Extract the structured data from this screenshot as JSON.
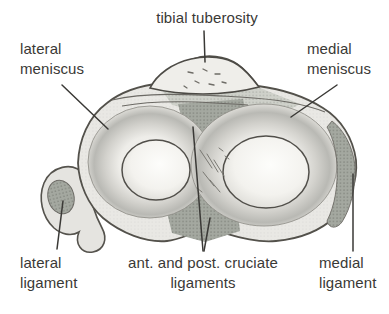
{
  "figure": {
    "type": "anatomical-diagram",
    "colors": {
      "background": "#ffffff",
      "label_text": "#3a3936",
      "leader_line": "#3a3936",
      "outline": "#53514b",
      "shade_light": "#e9e8e4",
      "shade_mid": "#c2c2bd",
      "shade_dark": "#a4a8a0"
    },
    "labels": {
      "tibial_tuberosity": "tibial tuberosity",
      "lateral_meniscus": {
        "line1": "lateral",
        "line2": "meniscus"
      },
      "medial_meniscus": {
        "line1": "medial",
        "line2": "meniscus"
      },
      "lateral_ligament": {
        "line1": "lateral",
        "line2": "ligament"
      },
      "cruciate_ligaments": {
        "line1": "ant. and post. cruciate",
        "line2": "ligaments"
      },
      "medial_ligament": {
        "line1": "medial",
        "line2": "ligament"
      }
    }
  }
}
